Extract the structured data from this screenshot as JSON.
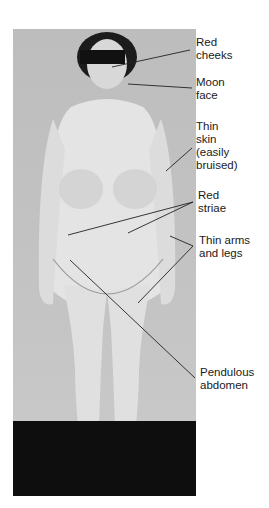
{
  "figure": {
    "labels": [
      {
        "id": "red-cheeks",
        "line1": "Red",
        "line2": "cheeks"
      },
      {
        "id": "moon-face",
        "line1": "Moon",
        "line2": "face"
      },
      {
        "id": "thin-skin",
        "line1": "Thin",
        "line2": "skin",
        "line3": "(easily",
        "line4": "bruised)"
      },
      {
        "id": "red-striae",
        "line1": "Red",
        "line2": "striae"
      },
      {
        "id": "thin-arms-legs",
        "line1": "Thin arms",
        "line2": "and legs"
      },
      {
        "id": "pendulous-abdomen",
        "line1": "Pendulous",
        "line2": "abdomen"
      }
    ]
  },
  "colors": {
    "background": "#ffffff",
    "photo_wall": "#c2c2c2",
    "floor": "#0e0e0e",
    "skin": "#e6e6e6",
    "hair": "#1c1c1c",
    "leader": "#222222"
  }
}
